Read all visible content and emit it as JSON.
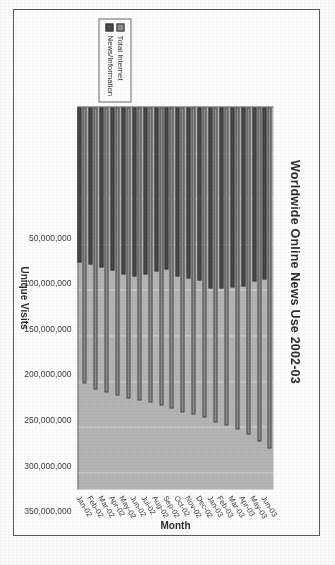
{
  "figure": {
    "title": "Worldwide Online News Use 2002-03"
  },
  "legend": {
    "items": [
      {
        "label": "Total Internet",
        "color": "#8e8e8e"
      },
      {
        "label": "News/Information",
        "color": "#4a4a4a"
      }
    ]
  },
  "axes": {
    "category_axis_title": "Month",
    "value_axis_title": "Unique Visits",
    "value_ticks": [
      "400,000,000",
      "350,000,000",
      "300,000,000",
      "250,000,000",
      "200,000,000",
      "150,000,000",
      "100,000,000",
      "50,000,000"
    ]
  },
  "chart_data": {
    "type": "bar",
    "orientation": "horizontal",
    "title": "Worldwide Online News Use 2002-03",
    "xlabel": "Unique Visits",
    "ylabel": "Month",
    "xlim": [
      0,
      420000000
    ],
    "grid": true,
    "legend_position": "bottom-right",
    "categories": [
      "Jan-02",
      "Feb-02",
      "Mar-02",
      "Apr-02",
      "May-02",
      "Jun-02",
      "Jul-02",
      "Aug-02",
      "Sep-02",
      "Oct-02",
      "Nov-02",
      "Dec-02",
      "Jan-03",
      "Feb-03",
      "Mar-03",
      "Apr-03",
      "May-03",
      "Jun-03"
    ],
    "series": [
      {
        "name": "Total Internet",
        "color": "#8e8e8e",
        "values": [
          303000000,
          309000000,
          313000000,
          316000000,
          319000000,
          321000000,
          323000000,
          327000000,
          330000000,
          334000000,
          337000000,
          340000000,
          345000000,
          349000000,
          353000000,
          359000000,
          366000000,
          374000000
        ]
      },
      {
        "name": "News/Information",
        "color": "#4a4a4a",
        "values": [
          170000000,
          172000000,
          176000000,
          179000000,
          183000000,
          185000000,
          183000000,
          180000000,
          178000000,
          185000000,
          188000000,
          190000000,
          199000000,
          198000000,
          197000000,
          196000000,
          191000000,
          189000000
        ]
      }
    ]
  }
}
